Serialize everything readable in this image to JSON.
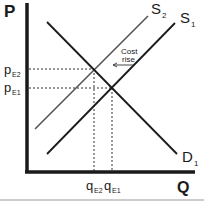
{
  "diagram": {
    "type": "supply-demand",
    "axes": {
      "y_label": "P",
      "x_label": "Q"
    },
    "curves": {
      "supply_original": {
        "label": "S",
        "sub": "1",
        "color": "#1a1a1a"
      },
      "supply_shifted": {
        "label": "S",
        "sub": "2",
        "color": "#555555"
      },
      "demand": {
        "label": "D",
        "sub": "1",
        "color": "#1a1a1a"
      }
    },
    "price_ticks": [
      {
        "label": "p",
        "sub": "E2"
      },
      {
        "label": "p",
        "sub": "E1"
      }
    ],
    "quantity_ticks": [
      {
        "label": "q",
        "sub": "E2"
      },
      {
        "label": "q",
        "sub": "E1"
      }
    ],
    "annotation": {
      "line1": "Cost",
      "line2": "rise"
    }
  }
}
